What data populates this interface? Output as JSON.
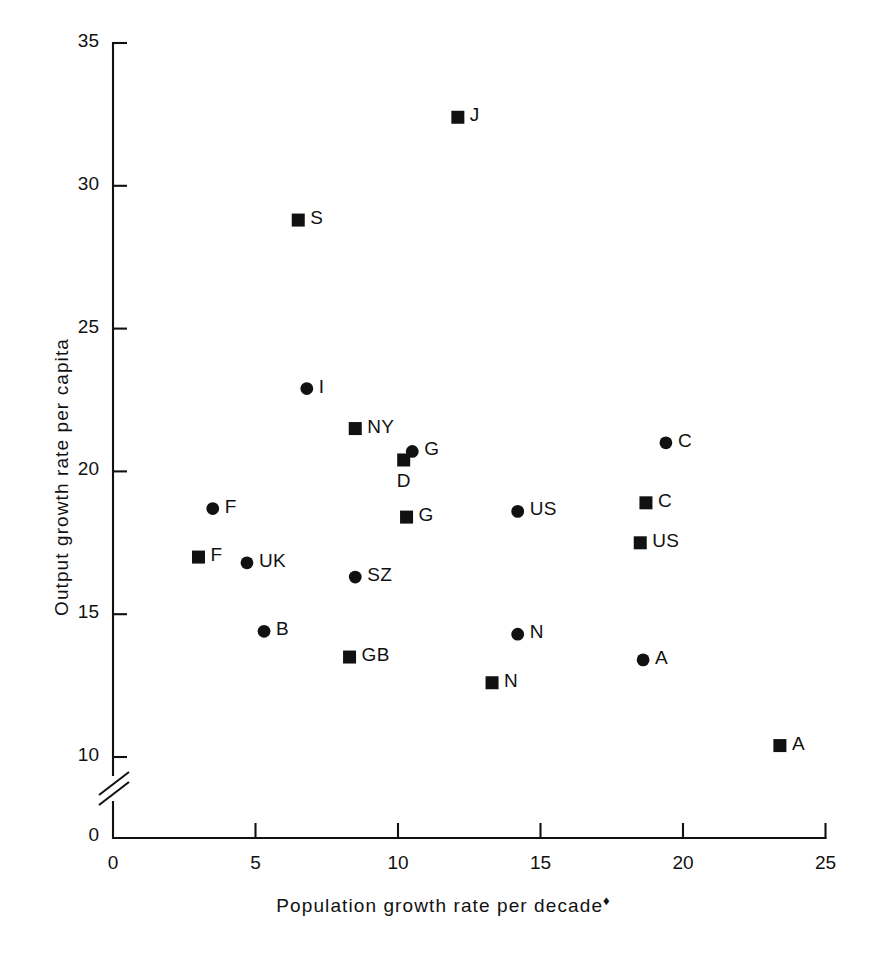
{
  "chart_data": {
    "type": "scatter",
    "title": "",
    "xlabel": "Population growth rate per decade",
    "xlabel_footnote": "♦",
    "ylabel": "Output growth rate per capita",
    "xlim": [
      0,
      25
    ],
    "ylim": [
      8.5,
      35
    ],
    "y_axis_break": true,
    "y_axis_break_note": "axis broken between 0 and 10",
    "grid": false,
    "legend": "none",
    "xticks": [
      0,
      5,
      10,
      15,
      20,
      25
    ],
    "xtick_labels": [
      "0",
      "5",
      "10",
      "15",
      "20",
      "25"
    ],
    "yticks": [
      10,
      15,
      20,
      25,
      30,
      35
    ],
    "ytick_labels": [
      "10",
      "15",
      "20",
      "25",
      "30",
      "35"
    ],
    "y_origin_label": "0",
    "marker_types": [
      "circle",
      "square"
    ],
    "points": [
      {
        "label": "J",
        "marker": "square",
        "x": 12.1,
        "y": 32.4,
        "label_pos": "right"
      },
      {
        "label": "S",
        "marker": "square",
        "x": 6.5,
        "y": 28.8,
        "label_pos": "right"
      },
      {
        "label": "I",
        "marker": "circle",
        "x": 6.8,
        "y": 22.9,
        "label_pos": "right"
      },
      {
        "label": "NY",
        "marker": "square",
        "x": 8.5,
        "y": 21.5,
        "label_pos": "right"
      },
      {
        "label": "C",
        "marker": "circle",
        "x": 19.4,
        "y": 21.0,
        "label_pos": "right"
      },
      {
        "label": "G",
        "marker": "circle",
        "x": 10.5,
        "y": 20.7,
        "label_pos": "right"
      },
      {
        "label": "D",
        "marker": "square",
        "x": 10.2,
        "y": 20.4,
        "label_pos": "below"
      },
      {
        "label": "C",
        "marker": "square",
        "x": 18.7,
        "y": 18.9,
        "label_pos": "right"
      },
      {
        "label": "F",
        "marker": "circle",
        "x": 3.5,
        "y": 18.7,
        "label_pos": "right"
      },
      {
        "label": "US",
        "marker": "circle",
        "x": 14.2,
        "y": 18.6,
        "label_pos": "right"
      },
      {
        "label": "G",
        "marker": "square",
        "x": 10.3,
        "y": 18.4,
        "label_pos": "right"
      },
      {
        "label": "US",
        "marker": "square",
        "x": 18.5,
        "y": 17.5,
        "label_pos": "right"
      },
      {
        "label": "F",
        "marker": "square",
        "x": 3.0,
        "y": 17.0,
        "label_pos": "right"
      },
      {
        "label": "UK",
        "marker": "circle",
        "x": 4.7,
        "y": 16.8,
        "label_pos": "right"
      },
      {
        "label": "SZ",
        "marker": "circle",
        "x": 8.5,
        "y": 16.3,
        "label_pos": "right"
      },
      {
        "label": "B",
        "marker": "circle",
        "x": 5.3,
        "y": 14.4,
        "label_pos": "right"
      },
      {
        "label": "N",
        "marker": "circle",
        "x": 14.2,
        "y": 14.3,
        "label_pos": "right"
      },
      {
        "label": "GB",
        "marker": "square",
        "x": 8.3,
        "y": 13.5,
        "label_pos": "right"
      },
      {
        "label": "A",
        "marker": "circle",
        "x": 18.6,
        "y": 13.4,
        "label_pos": "right"
      },
      {
        "label": "N",
        "marker": "square",
        "x": 13.3,
        "y": 12.6,
        "label_pos": "right"
      },
      {
        "label": "A",
        "marker": "square",
        "x": 23.4,
        "y": 10.4,
        "label_pos": "right"
      }
    ]
  }
}
